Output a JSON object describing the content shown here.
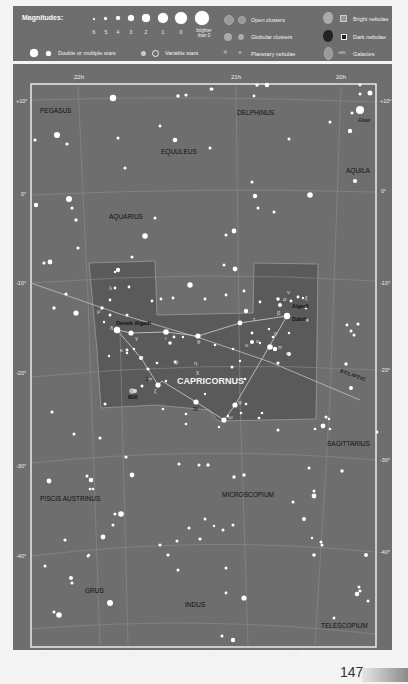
{
  "legend": {
    "magnitudes_title": "Magnitudes:",
    "magnitude_labels": [
      "6",
      "5",
      "4",
      "3",
      "2",
      "1",
      "0",
      "brighter than 0"
    ],
    "double_stars": "Double or multiple stars",
    "variable_stars": "Variable stars",
    "open_clusters": "Open clusters",
    "globular_clusters": "Globular clusters",
    "planetary_nebulae": "Planetary nebulae",
    "bright_nebulae": "Bright nebulae",
    "dark_nebulae": "Dark nebulae",
    "galaxies": "Galaxies"
  },
  "axes": {
    "ra_top": [
      "22h",
      "21h",
      "20h"
    ],
    "ra_bottom": [
      "23h",
      "22h",
      "21h",
      "20h"
    ],
    "dec_left": [
      "+10°",
      "0°",
      "-10°",
      "-20°",
      "-30°",
      "-40°"
    ],
    "dec_right": [
      "+10°",
      "0°",
      "-10°",
      "-20°",
      "-30°",
      "-40°"
    ]
  },
  "constellations": {
    "pegasus": "PEGASUS",
    "delphinus": "DELPHINUS",
    "equuleus": "EQUULEUS",
    "aquila": "AQUILA",
    "aquarius": "AQUARIUS",
    "capricornus": "CAPRICORNUS",
    "sagittarius": "SAGITTARIUS",
    "piscis_austrinus": "PISCIS AUSTRINUS",
    "microscopium": "MICROSCOPIUM",
    "grus": "GRUS",
    "indus": "INDUS",
    "telescopium": "TELESCOPIUM"
  },
  "star_names": {
    "altair": "Altair",
    "deneb_algedi": "Deneb Algedi",
    "algedi": "Algedi",
    "dabih": "Dabih"
  },
  "greek_labels": {
    "alpha": "α",
    "beta": "β",
    "gamma": "γ",
    "delta": "δ",
    "epsilon": "ε",
    "zeta": "ζ",
    "eta": "η",
    "theta": "θ",
    "iota": "ι",
    "kappa": "κ",
    "lambda": "λ",
    "mu": "μ",
    "nu": "ν",
    "xi": "ξ",
    "omicron": "ο",
    "pi": "π",
    "rho": "ρ",
    "upsilon": "υ",
    "phi": "φ",
    "chi": "χ",
    "psi": "ψ",
    "omega": "ω"
  },
  "objects": {
    "m30": "M30",
    "num_24": "24",
    "num_36": "36"
  },
  "ecliptic_label": "ECLIPTIC",
  "page_number": "147"
}
